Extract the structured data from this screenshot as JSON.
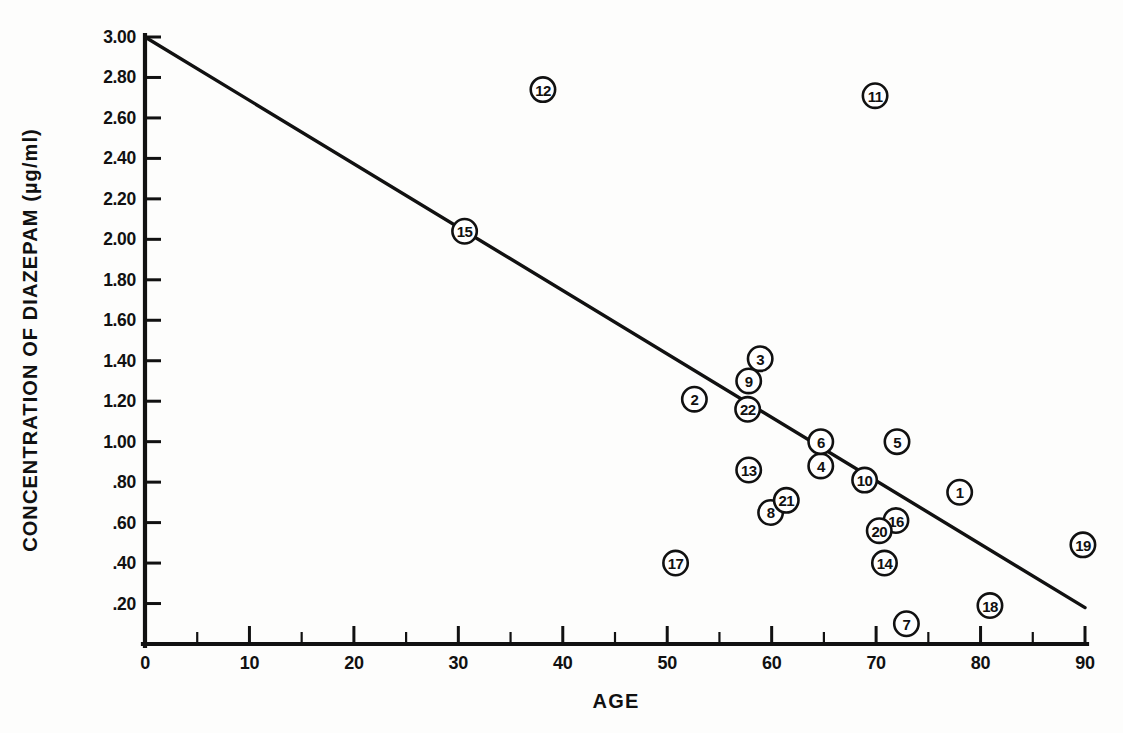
{
  "chart_data": {
    "type": "scatter",
    "title": "",
    "xlabel": "AGE",
    "ylabel": "CONCENTRATION OF DIAZEPAM (µg/ml)",
    "xlim": [
      0,
      90
    ],
    "ylim": [
      0,
      3.0
    ],
    "grid": false,
    "legend": "none",
    "x_ticks": [
      "0",
      "10",
      "20",
      "30",
      "40",
      "50",
      "60",
      "70",
      "80",
      "90"
    ],
    "x_tick_values": [
      0,
      10,
      20,
      30,
      40,
      50,
      60,
      70,
      80,
      90
    ],
    "x_minor_tick_values": [
      5,
      15,
      25,
      35,
      45,
      55,
      65,
      75,
      85
    ],
    "y_ticks": [
      ".20",
      ".40",
      ".60",
      ".80",
      "1.00",
      "1.20",
      "1.40",
      "1.60",
      "1.80",
      "2.00",
      "2.20",
      "2.40",
      "2.60",
      "2.80",
      "3.00"
    ],
    "y_tick_values": [
      0.2,
      0.4,
      0.6,
      0.8,
      1.0,
      1.2,
      1.4,
      1.6,
      1.8,
      2.0,
      2.2,
      2.4,
      2.6,
      2.8,
      3.0
    ],
    "marker_style": "numbered-circle",
    "points": [
      {
        "label": "1",
        "x": 78.0,
        "y": 0.75
      },
      {
        "label": "2",
        "x": 52.6,
        "y": 1.21
      },
      {
        "label": "3",
        "x": 58.9,
        "y": 1.41
      },
      {
        "label": "4",
        "x": 64.7,
        "y": 0.88
      },
      {
        "label": "5",
        "x": 72.0,
        "y": 1.0
      },
      {
        "label": "6",
        "x": 64.7,
        "y": 1.0
      },
      {
        "label": "7",
        "x": 72.9,
        "y": 0.1
      },
      {
        "label": "8",
        "x": 59.9,
        "y": 0.65
      },
      {
        "label": "9",
        "x": 57.8,
        "y": 1.3
      },
      {
        "label": "10",
        "x": 68.9,
        "y": 0.81
      },
      {
        "label": "11",
        "x": 69.9,
        "y": 2.71
      },
      {
        "label": "12",
        "x": 38.1,
        "y": 2.74
      },
      {
        "label": "13",
        "x": 57.8,
        "y": 0.86
      },
      {
        "label": "14",
        "x": 70.8,
        "y": 0.4
      },
      {
        "label": "15",
        "x": 30.6,
        "y": 2.04
      },
      {
        "label": "16",
        "x": 71.9,
        "y": 0.61
      },
      {
        "label": "17",
        "x": 50.8,
        "y": 0.4
      },
      {
        "label": "18",
        "x": 80.9,
        "y": 0.19
      },
      {
        "label": "19",
        "x": 89.8,
        "y": 0.49
      },
      {
        "label": "20",
        "x": 70.3,
        "y": 0.56
      },
      {
        "label": "21",
        "x": 61.4,
        "y": 0.71
      },
      {
        "label": "22",
        "x": 57.7,
        "y": 1.16
      }
    ],
    "regression_line": {
      "x_start": 0.0,
      "y_start": 3.0,
      "x_end": 90.0,
      "y_end": 0.18,
      "slope": -0.0313,
      "intercept": 3.0
    },
    "colors": {
      "ink": "#111111",
      "background": "#fdfdfc",
      "marker_fill": "#ffffff"
    }
  }
}
